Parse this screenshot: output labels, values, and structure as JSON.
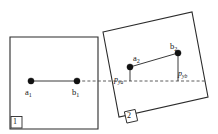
{
  "figure": {
    "canvas": {
      "width": 218,
      "height": 134,
      "background": "#ffffff"
    },
    "stroke_color": "#2b2b2b",
    "dot_color": "#111111",
    "dash_color": "#4a4a4a"
  },
  "shapes": {
    "box1": {
      "tag": "1",
      "orientation": "axis-aligned",
      "points": "10,37 98,37 98,129 10,129"
    },
    "box2": {
      "tag": "2",
      "orientation": "rotated",
      "points": "103,32 192,12 208,97 119,117"
    }
  },
  "points": {
    "a1": {
      "label": "a",
      "sub": "1",
      "x": 31,
      "y": 81
    },
    "b1": {
      "label": "b",
      "sub": "1",
      "x": 77,
      "y": 81
    },
    "a2": {
      "label": "a",
      "sub": "2",
      "x": 130,
      "y": 67
    },
    "b2": {
      "label": "b",
      "sub": "2",
      "x": 178,
      "y": 53
    }
  },
  "projections": {
    "pya": {
      "label": "p",
      "sub": "ya"
    },
    "pyb": {
      "label": "p",
      "sub": "yb"
    }
  },
  "lines": {
    "segment1": {
      "from": "a1",
      "to": "b1",
      "style": "solid"
    },
    "segment2": {
      "from": "a2",
      "to": "b2",
      "style": "solid"
    },
    "reference": {
      "y": 81,
      "x_start": 77,
      "x_end": 205,
      "style": "dashed"
    },
    "drop_b2": {
      "x": 178,
      "y_start": 53,
      "y_end": 81,
      "style": "solid"
    }
  }
}
